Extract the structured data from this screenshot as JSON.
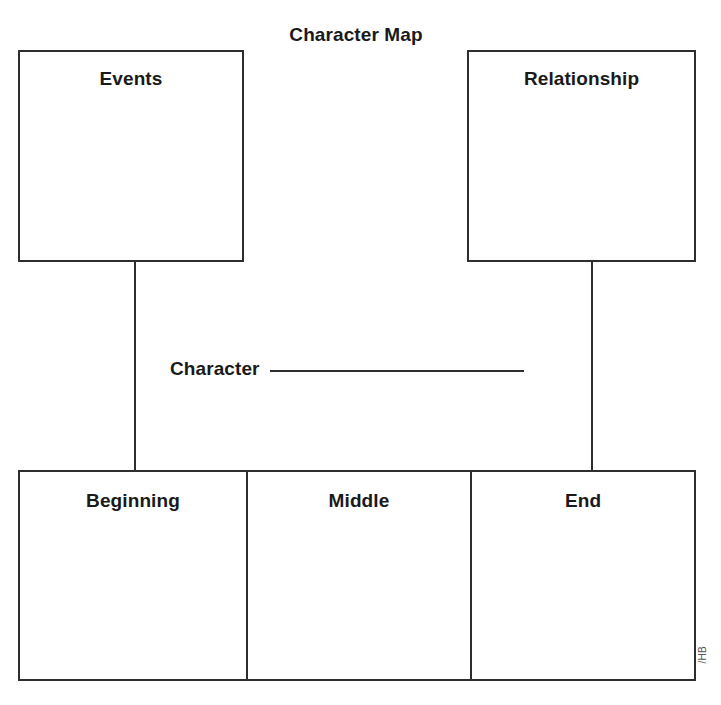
{
  "page": {
    "title": "Character Map",
    "credit": "/HB",
    "ink_color": "#2e2e30",
    "text_color": "#1a1a1a",
    "background_color": "#ffffff"
  },
  "top_boxes": [
    {
      "label": "Events",
      "content": ""
    },
    {
      "label": "Relationship",
      "content": ""
    }
  ],
  "character": {
    "label": "Character",
    "value": ""
  },
  "stages": [
    {
      "label": "Beginning",
      "content": ""
    },
    {
      "label": "Middle",
      "content": ""
    },
    {
      "label": "End",
      "content": ""
    }
  ]
}
